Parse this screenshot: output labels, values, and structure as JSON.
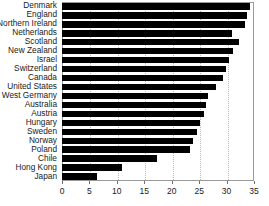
{
  "chart_data": {
    "type": "bar",
    "orientation": "horizontal",
    "title": "",
    "subtitle": "",
    "xlabel": "",
    "ylabel": "",
    "xlim": [
      0,
      35
    ],
    "xticks": [
      0,
      5,
      10,
      15,
      20,
      25,
      30,
      35
    ],
    "xtick_labels": [
      "0",
      "5",
      "10",
      "15",
      "20",
      "25",
      "30",
      "35"
    ],
    "grid": true,
    "grid_axis": "x",
    "legend": false,
    "bar_color": "#000000",
    "frame_color": "#9a9a9a",
    "categories": [
      "Denmark",
      "England",
      "Northern Ireland",
      "Netherlands",
      "Scotland",
      "New Zealand",
      "Israel",
      "Switzerland",
      "Canada",
      "United States",
      "West Germany",
      "Australia",
      "Austria",
      "Hungary",
      "Sweden",
      "Norway",
      "Poland",
      "Chile",
      "Hong Kong",
      "Japan"
    ],
    "values": [
      34.2,
      33.8,
      33.3,
      31.0,
      32.2,
      31.2,
      30.5,
      29.9,
      29.4,
      28.0,
      26.7,
      26.3,
      25.9,
      25.2,
      24.6,
      23.9,
      23.4,
      17.3,
      11.0,
      6.4
    ]
  }
}
